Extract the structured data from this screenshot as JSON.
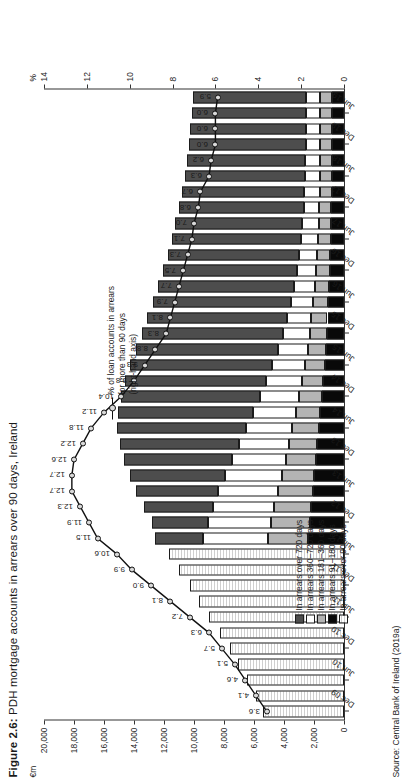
{
  "figure": {
    "label": "Figure 2.6:",
    "title": "PDH mortgage accounts in arrears over 90 days, Ireland",
    "source": "Source: Central Bank of Ireland (2019a)"
  },
  "legend": {
    "items": [
      {
        "label": "In arrears over 720 days",
        "color": "#4d4d4d",
        "key": "over720"
      },
      {
        "label": "In arrears 360–720 days",
        "color": "#ffffff",
        "key": "d360_720"
      },
      {
        "label": "In arrears 181–360 days",
        "color": "#b4b4b4",
        "key": "d181_360"
      },
      {
        "label": "In arrears 91–180 days",
        "color": "#090909",
        "key": "d91_180"
      },
      {
        "label": "In arrears over 90 days",
        "color": "#ffffff",
        "key": "over90"
      }
    ],
    "line_key": "% of loan accounts in arrears\nfor more than 90 days\n(right-hand axis)"
  },
  "chart_data": {
    "type": "bar",
    "title": "PDH mortgage accounts in arrears over 90 days, Ireland",
    "xlabel": "",
    "ylabel": "€m",
    "y2label": "%",
    "ylim": [
      0,
      20000
    ],
    "y2lim": [
      0,
      14
    ],
    "yticks": [
      0,
      2000,
      4000,
      6000,
      8000,
      10000,
      12000,
      14000,
      16000,
      18000,
      20000
    ],
    "ytick_labels": [
      "0",
      "2,000",
      "4,000",
      "6,000",
      "8,000",
      "10,000",
      "12,000",
      "14,000",
      "16,000",
      "18,000",
      "20,000"
    ],
    "y2ticks": [
      0,
      2,
      4,
      6,
      8,
      10,
      12,
      14
    ],
    "y2tick_labels": [
      "0",
      "2",
      "4",
      "6",
      "8",
      "10",
      "12",
      "14"
    ],
    "grid": false,
    "legend_position": "inside-left",
    "categories": [
      "Dec 09",
      "Jun 10",
      "Dec 10",
      "Jun 11",
      "Dec 11",
      "Jun 12",
      "Dec 12",
      "Jun 13",
      "Dec 13",
      "Jun 14",
      "Dec 14",
      "Jun 15",
      "Dec 15",
      "Jun 16",
      "Dec 16",
      "Jun 17",
      "Dec 17",
      "Jun 18",
      "Dec 18",
      "Jun 19"
    ],
    "tick_labels_shown": [
      "Dec 09",
      "Jun 10",
      "Dec 10",
      "Jun 11",
      "Dec 11",
      "Jun 12",
      "Dec 12",
      "Jun 13",
      "Dec 13",
      "Jun 14",
      "Dec 14",
      "Jun 15",
      "Dec 15",
      "Jun 16",
      "Dec 16",
      "Jun 17",
      "Dec 17",
      "Jun 18",
      "Dec 18",
      "Jun 19"
    ],
    "periods": [
      "Dec 09",
      "Jun 10",
      "Dec 10",
      "Jun 11",
      "Dec 11",
      "Jun 12",
      "Dec 12",
      "Jun 13",
      "Dec 13",
      "Jun 14",
      "Dec 14",
      "Jun 15",
      "Dec 15",
      "Jun 16",
      "Dec 16",
      "Jun 17",
      "Dec 17",
      "Jun 18",
      "Dec 18",
      "Jun 19"
    ],
    "series": [
      {
        "name": "In arrears over 90 days",
        "key": "over90",
        "color": "#ffffff",
        "note": "single aggregate bar used for Dec 09 – Jun 12 only",
        "values": [
          5400,
          6500,
          7600,
          9000,
          10300,
          11700,
          null,
          null,
          null,
          null,
          null,
          null,
          null,
          null,
          null,
          null,
          null,
          null,
          null,
          null
        ]
      },
      {
        "name": "In arrears 91–180 days",
        "key": "d91_180",
        "color": "#090909",
        "values": [
          null,
          null,
          null,
          null,
          null,
          null,
          2300,
          2100,
          1900,
          1700,
          1500,
          1300,
          1150,
          1050,
          950,
          900,
          850,
          800,
          800,
          800
        ]
      },
      {
        "name": "In arrears 181–360 days",
        "key": "d181_360",
        "color": "#b4b4b4",
        "values": [
          null,
          null,
          null,
          null,
          null,
          null,
          2600,
          2300,
          2000,
          1750,
          1500,
          1300,
          1150,
          1000,
          900,
          850,
          800,
          800,
          800,
          800
        ]
      },
      {
        "name": "In arrears 360–720 days",
        "key": "d360_720",
        "color": "#ffffff",
        "values": [
          null,
          null,
          null,
          null,
          null,
          null,
          4200,
          4000,
          3600,
          3100,
          2600,
          2200,
          1800,
          1500,
          1300,
          1150,
          1050,
          1000,
          950,
          950
        ]
      },
      {
        "name": "In arrears over 720 days",
        "key": "over720",
        "color": "#4d4d4d",
        "values": [
          null,
          null,
          null,
          null,
          null,
          null,
          3700,
          5500,
          7200,
          8600,
          9300,
          9500,
          9400,
          9200,
          8900,
          8600,
          8300,
          8000,
          7800,
          7600
        ]
      }
    ],
    "line_series": {
      "name": "% of loan accounts in arrears for more than 90 days (right-hand axis)",
      "axis": "right",
      "unit": "%",
      "points": [
        {
          "period": "Dec 09",
          "value": 3.6
        },
        {
          "period": "Jun 10",
          "value": 4.1
        },
        {
          "period": "Dec 10",
          "value": 4.6
        },
        {
          "period": "Jun 11",
          "value": 5.1
        },
        {
          "period": "Dec 11",
          "value": 5.7
        },
        {
          "period": "Jun 12",
          "value": 6.3
        },
        {
          "period": "Dec 12",
          "value": 7.2
        },
        {
          "period": "Jun 13",
          "value": 8.1
        },
        {
          "period": "Dec 13",
          "value": 9.0
        },
        {
          "period": "Jun 14",
          "value": 9.9
        },
        {
          "period": "Dec 14",
          "value": 10.6
        },
        {
          "period": "Jun 15",
          "value": 11.5
        },
        {
          "period": "Dec 15",
          "value": 11.9
        },
        {
          "period": "Jun 16",
          "value": 12.3
        },
        {
          "period": "Dec 16",
          "value": 12.7
        },
        {
          "period": "Jun 17",
          "value": 12.7
        },
        {
          "period": "Dec 17",
          "value": 12.6
        },
        {
          "period": "Jun 18",
          "value": 12.2
        },
        {
          "period": "Dec 18",
          "value": 11.8
        },
        {
          "period": "Jun 19",
          "value": 11.2
        },
        {
          "period": "",
          "value": 10.4
        },
        {
          "period": "",
          "value": 9.8
        },
        {
          "period": "",
          "value": 9.3
        },
        {
          "period": "",
          "value": 8.8
        },
        {
          "period": "",
          "value": 8.3
        },
        {
          "period": "",
          "value": 8.1
        },
        {
          "period": "",
          "value": 7.9
        },
        {
          "period": "",
          "value": 7.7
        },
        {
          "period": "",
          "value": 7.5
        },
        {
          "period": "",
          "value": 7.3
        },
        {
          "period": "",
          "value": 7.1
        },
        {
          "period": "",
          "value": 7.0
        },
        {
          "period": "",
          "value": 6.8
        },
        {
          "period": "",
          "value": 6.7
        },
        {
          "period": "",
          "value": 6.3
        },
        {
          "period": "",
          "value": 6.2
        },
        {
          "period": "",
          "value": 6.0
        },
        {
          "period": "",
          "value": 6.0
        },
        {
          "period": "",
          "value": 6.0
        },
        {
          "period": "",
          "value": 5.9
        }
      ]
    },
    "bars_full": {
      "comment": "40 half-year observations, Dec 09 → Jun 19 is shown as 40 bars; euro-m stacked components",
      "labels": [
        "Dec 09",
        "Mar 10",
        "Jun 10",
        "Sep 10",
        "Dec 10",
        "Mar 11",
        "Jun 11",
        "Sep 11",
        "Dec 11",
        "Mar 12",
        "Jun 12",
        "Sep 12",
        "Dec 12",
        "Mar 13",
        "Jun 13",
        "Sep 13",
        "Dec 13",
        "Mar 14",
        "Jun 14",
        "Sep 14",
        "Dec 14",
        "Mar 15",
        "Jun 15",
        "Sep 15",
        "Dec 15",
        "Mar 16",
        "Jun 16",
        "Sep 16",
        "Dec 16",
        "Mar 17",
        "Jun 17",
        "Sep 17",
        "Dec 17",
        "Mar 18",
        "Jun 18",
        "Sep 18",
        "Dec 18",
        "Mar 19",
        "Jun 19",
        "Sep 19"
      ],
      "over90": [
        5400,
        5900,
        6500,
        7050,
        7600,
        8300,
        9000,
        9650,
        10300,
        11000,
        11700,
        null,
        null,
        null,
        null,
        null,
        null,
        null,
        null,
        null,
        null,
        null,
        null,
        null,
        null,
        null,
        null,
        null,
        null,
        null,
        null,
        null,
        null,
        null,
        null,
        null,
        null,
        null,
        null,
        null
      ],
      "d91_180": [
        null,
        null,
        null,
        null,
        null,
        null,
        null,
        null,
        null,
        null,
        null,
        2400,
        2300,
        2200,
        2100,
        2000,
        1900,
        1800,
        1700,
        1600,
        1500,
        1400,
        1300,
        1200,
        1150,
        1100,
        1050,
        1000,
        950,
        920,
        900,
        870,
        850,
        830,
        800,
        800,
        800,
        800,
        800,
        800
      ],
      "d181_360": [
        null,
        null,
        null,
        null,
        null,
        null,
        null,
        null,
        null,
        null,
        null,
        2700,
        2600,
        2450,
        2300,
        2150,
        2000,
        1880,
        1750,
        1620,
        1500,
        1400,
        1300,
        1220,
        1150,
        1080,
        1000,
        950,
        900,
        870,
        850,
        820,
        800,
        800,
        800,
        800,
        800,
        800,
        800,
        800
      ],
      "d360_720": [
        null,
        null,
        null,
        null,
        null,
        null,
        null,
        null,
        null,
        null,
        null,
        4300,
        4200,
        4100,
        4000,
        3800,
        3600,
        3350,
        3100,
        2850,
        2600,
        2400,
        2200,
        2000,
        1800,
        1650,
        1500,
        1400,
        1300,
        1220,
        1150,
        1100,
        1050,
        1020,
        1000,
        980,
        950,
        950,
        950,
        950
      ],
      "over720": [
        null,
        null,
        null,
        null,
        null,
        null,
        null,
        null,
        null,
        null,
        null,
        3200,
        3700,
        4600,
        5500,
        6350,
        7200,
        7900,
        8600,
        9000,
        9300,
        9400,
        9500,
        9450,
        9400,
        9300,
        9200,
        9050,
        8900,
        8750,
        8600,
        8450,
        8300,
        8150,
        8000,
        7900,
        7800,
        7700,
        7600,
        7500
      ]
    }
  }
}
